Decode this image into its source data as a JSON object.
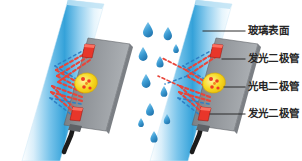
{
  "figure": {
    "background_color": "#ffffff",
    "width": 302,
    "height": 161
  },
  "palette": {
    "glass_light": "#eaf6fd",
    "glass_mid": "#7fc6ec",
    "glass_deep": "#2e9fd8",
    "glass_edge": "#bfe3f5",
    "sensor_body": "#8d9196",
    "sensor_body_dark": "#6f7378",
    "sensor_body_light": "#a9adb1",
    "led_red": "#e8362a",
    "led_red_dark": "#a8201a",
    "photodiode_yellow": "#f6d81f",
    "photodiode_spot": "#ef3e23",
    "ray_red": "#e8453a",
    "ray_blue": "#2f7fc4",
    "droplet_blue": "#3f9fd6",
    "droplet_blue_dark": "#2277b4",
    "cable_black": "#1b1b1b",
    "leader_line": "#2b2b2b",
    "label_text": "#262626"
  },
  "panels": [
    {
      "id": "panel-dry",
      "name": "dry-glass-panel",
      "caption": "",
      "has_droplets": false,
      "description": "Glass pane with sensor module; LED light totally internally reflected back to photodiode"
    },
    {
      "id": "panel-wet",
      "name": "wet-glass-panel",
      "caption": "",
      "has_droplets": true,
      "description": "Glass pane covered with rain droplets; part of the LED light escapes through the water so less light reaches the photodiode"
    }
  ],
  "labels": [
    {
      "id": "glass-surface",
      "text": "玻璃表面",
      "target": "glass-pane"
    },
    {
      "id": "led-top",
      "text": "发光二极管",
      "target": "led-upper"
    },
    {
      "id": "photodiode",
      "text": "光电二极管",
      "target": "photodiode"
    },
    {
      "id": "led-bottom",
      "text": "发光二极管",
      "target": "led-lower"
    }
  ],
  "components": {
    "glass_pane": "玻璃表面",
    "led": "发光二极管",
    "photodiode": "光电二极管",
    "sensor_body": "sensor-module-body",
    "cable": "sensor-cable",
    "droplet": "water-droplet",
    "light_ray": "light-ray"
  }
}
